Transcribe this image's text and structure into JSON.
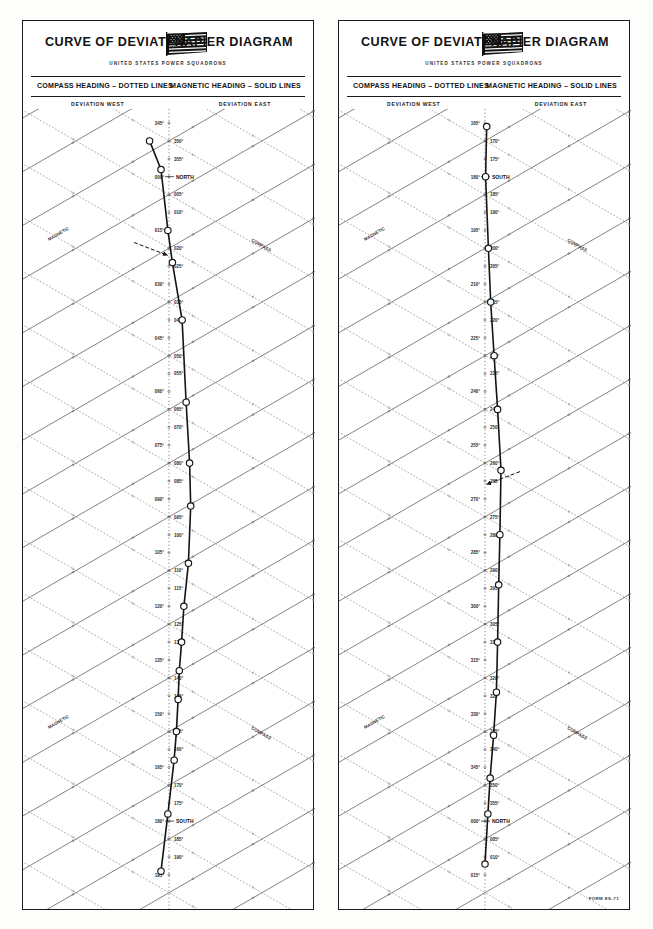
{
  "document": {
    "title": "CURVE OF DEVIATIONS",
    "title_right": "NAPIER DIAGRAM",
    "subtitle": "UNITED STATES POWER SQUADRONS",
    "legend_left": "COMPASS HEADING – DOTTED LINES",
    "legend_right": "MAGNETIC HEADING – SOLID LINES",
    "deviation_west": "DEVIATION WEST",
    "deviation_east": "DEVIATION EAST",
    "magnetic_label": "MAGNETIC",
    "compass_label": "COMPASS",
    "form_number": "FORM ES-71",
    "colors": {
      "ink": "#1a1a1a",
      "grid_solid": "#555555",
      "grid_dotted": "#777777",
      "curve": "#111111",
      "paper": "#ffffff"
    }
  },
  "panels": [
    {
      "id": "left",
      "name": "panel-left",
      "axis_start_deg": 345,
      "axis_end_deg": 195,
      "cardinal_labels": [
        {
          "deg": 360,
          "text": "NORTH"
        },
        {
          "deg": 180,
          "text": "SOUTH"
        }
      ],
      "axis_ticks": [
        "345°",
        "350°",
        "355°",
        "000°",
        "005°",
        "010°",
        "015°",
        "020°",
        "025°",
        "030°",
        "035°",
        "040°",
        "045°",
        "050°",
        "055°",
        "060°",
        "065°",
        "070°",
        "075°",
        "080°",
        "085°",
        "090°",
        "095°",
        "100°",
        "105°",
        "110°",
        "115°",
        "120°",
        "125°",
        "130°",
        "135°",
        "140°",
        "145°",
        "150°",
        "155°",
        "160°",
        "165°",
        "170°",
        "175°",
        "180°",
        "185°",
        "190°",
        "195°"
      ],
      "has_arrow_annotation": true,
      "arrow_at_deg": 22
    },
    {
      "id": "right",
      "name": "panel-right",
      "axis_start_deg": 165,
      "axis_end_deg": 375,
      "cardinal_labels": [
        {
          "deg": 180,
          "text": "SOUTH"
        },
        {
          "deg": 360,
          "text": "NORTH"
        }
      ],
      "axis_ticks": [
        "165°",
        "170°",
        "175°",
        "180°",
        "185°",
        "190°",
        "195°",
        "200°",
        "205°",
        "210°",
        "215°",
        "220°",
        "225°",
        "230°",
        "235°",
        "240°",
        "245°",
        "250°",
        "255°",
        "260°",
        "265°",
        "270°",
        "275°",
        "280°",
        "285°",
        "290°",
        "295°",
        "300°",
        "305°",
        "310°",
        "315°",
        "320°",
        "325°",
        "330°",
        "335°",
        "340°",
        "345°",
        "350°",
        "355°",
        "000°",
        "005°",
        "010°",
        "015°"
      ],
      "has_arrow_annotation": true,
      "arrow_at_deg": 266
    }
  ],
  "chart_data": {
    "type": "line",
    "xlabel": "Deviation (West ← | → East)",
    "ylabel": "Magnetic / Compass heading (degrees)",
    "grid": true,
    "legend_position": "top",
    "series": [
      {
        "name": "Left panel deviation curve (345° – 195°)",
        "panel": "left",
        "heading_deg": [
          350,
          358,
          15,
          24,
          40,
          63,
          80,
          92,
          108,
          120,
          130,
          138,
          146,
          155,
          163,
          178,
          194
        ],
        "deviation_deg": [
          3.4,
          1.4,
          0.2,
          -0.6,
          -2.3,
          -3.0,
          -3.6,
          -3.8,
          -3.4,
          -2.6,
          -2.2,
          -1.8,
          -1.6,
          -1.3,
          -0.9,
          0.2,
          1.4
        ]
      },
      {
        "name": "Right panel deviation curve (165° – 015°)",
        "panel": "right",
        "heading_deg": [
          166,
          180,
          200,
          215,
          230,
          245,
          262,
          280,
          294,
          310,
          324,
          336,
          348,
          358,
          372
        ],
        "deviation_deg": [
          0.3,
          0.1,
          0.6,
          1.0,
          1.6,
          2.2,
          2.8,
          2.6,
          2.4,
          2.2,
          2.0,
          1.5,
          0.9,
          0.5,
          0.0
        ]
      }
    ]
  }
}
